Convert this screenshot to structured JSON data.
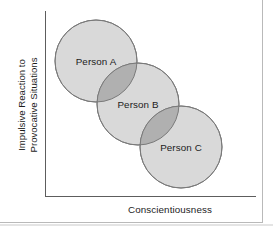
{
  "figure": {
    "type": "conceptual-scatter-venn",
    "background_color": "#ffffff",
    "axis_color": "#5d5d5d",
    "frame_color": "#b9b9b9"
  },
  "axes": {
    "y_label_line1": "Impulsive Reaction to",
    "y_label_line2": "Provocative Situations",
    "x_label": "Conscientiousness",
    "y_axis_name": "y-axis-line",
    "x_axis_name": "x-axis-line",
    "ticks": [],
    "grid": false
  },
  "chart_data": {
    "type": "scatter",
    "title": "",
    "xlabel": "Conscientiousness",
    "ylabel": "Impulsive Reaction to Provocative Situations",
    "xlim": [
      0,
      100
    ],
    "ylim": [
      0,
      100
    ],
    "grid": false,
    "legend": "none",
    "note": "Three overlapping circles arranged along a negative diagonal, illustrating an inverse relationship between conscientiousness and impulsive reaction.",
    "fill_color": "#d9d9d9",
    "overlap_color": "#b0b0b0",
    "stroke_color": "#7a7a7a",
    "points": [
      {
        "label": "Person A",
        "cx": 96,
        "cy": 61,
        "r": 41,
        "x_value": 24,
        "y_value": 73
      },
      {
        "label": "Person B",
        "cx": 138,
        "cy": 104,
        "r": 41,
        "x_value": 44,
        "y_value": 50
      },
      {
        "label": "Person C",
        "cx": 181,
        "cy": 147,
        "r": 41,
        "x_value": 65,
        "y_value": 26
      }
    ]
  },
  "circles": [
    {
      "id": "person-a",
      "label": "Person A",
      "cx": 96,
      "cy": 61,
      "r": 41,
      "fill": "#d9d9d9",
      "stroke": "#7a7a7a"
    },
    {
      "id": "person-b",
      "label": "Person B",
      "cx": 138,
      "cy": 104,
      "r": 41,
      "fill": "#d9d9d9",
      "stroke": "#7a7a7a"
    },
    {
      "id": "person-c",
      "label": "Person C",
      "cx": 181,
      "cy": 147,
      "r": 41,
      "fill": "#d9d9d9",
      "stroke": "#7a7a7a"
    }
  ],
  "overlaps": [
    {
      "id": "overlap-ab",
      "between": "Person A and Person B",
      "fill": "#b0b0b0"
    },
    {
      "id": "overlap-bc",
      "between": "Person B and Person C",
      "fill": "#b0b0b0"
    }
  ]
}
